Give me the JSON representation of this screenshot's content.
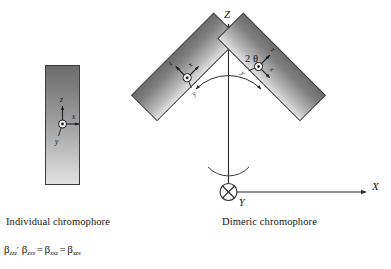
{
  "figure": {
    "captions": {
      "individual": "Individual chromophore",
      "dimeric": "Dimeric chromophore"
    },
    "formula": {
      "symbol": "β",
      "term1_sub": "zzz",
      "prime": "′",
      "term2_sub": "zxx",
      "term3_sub": "xxz",
      "term4_sub": "xzx",
      "equals": "=",
      "full_text": "βzzz′ βzxx = βxxz = βxzx"
    }
  },
  "individual_chromophore": {
    "local_axes": {
      "z": "z",
      "x": "x",
      "y": "y"
    },
    "origin_marker": "circled-dot"
  },
  "dimeric_chromophore": {
    "global_axes": {
      "Z": "Z",
      "X": "X",
      "Y": "Y"
    },
    "origin_marker": "circled-cross",
    "angle_label": "2 θ",
    "tilt_degrees": 45,
    "left_slab": {
      "local_axes": {
        "z": "z",
        "x": "x",
        "y": "y"
      }
    },
    "right_slab": {
      "local_axes": {
        "z": "z",
        "x": "x",
        "y": "y"
      }
    }
  },
  "colors": {
    "slab_dark": "#6e6e6e",
    "slab_light": "#dcdcdc",
    "outline": "#3a3a3a",
    "axis": "#2b2b2b",
    "text": "#161616"
  }
}
